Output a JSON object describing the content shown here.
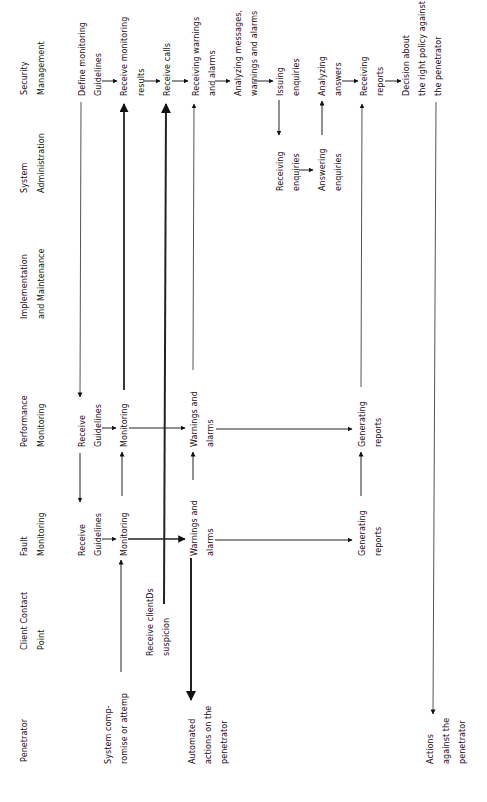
{
  "lanes": [
    {
      "id": "security",
      "l1": "Security",
      "l2": "Management"
    },
    {
      "id": "sysadmin",
      "l1": "System",
      "l2": "Administration"
    },
    {
      "id": "impl",
      "l1": "Implementation",
      "l2": "and Maintenance"
    },
    {
      "id": "perf",
      "l1": "Performance",
      "l2": "Monitoring"
    },
    {
      "id": "fault",
      "l1": "Fault",
      "l2": "Monitoring"
    },
    {
      "id": "client",
      "l1": "Client Contact",
      "l2": "Point"
    },
    {
      "id": "pen",
      "l1": "Penetrator",
      "l2": ""
    }
  ],
  "nodes": {
    "sec_define": {
      "l1": "Define monitoring",
      "l2": "Guidelines"
    },
    "sec_recv_mon": {
      "l1": "Receive monitoring",
      "l2": "results"
    },
    "sec_recv_calls": {
      "l1": "Receive calls",
      "l2": ""
    },
    "sec_recv_warn": {
      "l1": "Receiving warnings",
      "l2": "and alarms"
    },
    "sec_analyze": {
      "l1": "Analyzing messages,",
      "l2": "warnings and alarms"
    },
    "sec_issue": {
      "l1": "Issuing",
      "l2": "enquiries"
    },
    "sec_analyze_ans": {
      "l1": "Analyzing",
      "l2": "answers"
    },
    "sec_recv_reports": {
      "l1": "Receiving",
      "l2": "reports"
    },
    "sec_decision": {
      "l1": "Decision about",
      "l2": "the right policy against",
      "l3": "the penetrator"
    },
    "sa_recv_enq": {
      "l1": "Receiving",
      "l2": "enquiries"
    },
    "sa_answer": {
      "l1": "Answering",
      "l2": "enquiries"
    },
    "perf_recv": {
      "l1": "Receive",
      "l2": "Guidelines"
    },
    "perf_mon": {
      "l1": "Monitoring",
      "l2": ""
    },
    "perf_warn": {
      "l1": "Warnings and",
      "l2": "alarms"
    },
    "perf_gen": {
      "l1": "Generating",
      "l2": "reports"
    },
    "fault_recv": {
      "l1": "Receive",
      "l2": "Guidelines"
    },
    "fault_mon": {
      "l1": "Monitoring",
      "l2": ""
    },
    "fault_warn": {
      "l1": "Warnings and",
      "l2": "alarms"
    },
    "fault_gen": {
      "l1": "Generating",
      "l2": "reports"
    },
    "client_recv": {
      "l1": "Receive clientDs",
      "l2": "suspicion"
    },
    "pen_comp": {
      "l1": "System comp-",
      "l2": "romise or attemp"
    },
    "pen_auto": {
      "l1": "Automated",
      "l2": "actions on the",
      "l3": "penetrator"
    },
    "pen_actions": {
      "l1": "Actions",
      "l2": "against the",
      "l3": "penetrator"
    }
  }
}
